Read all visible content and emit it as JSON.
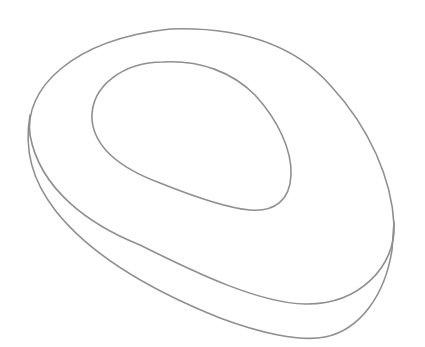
{
  "drawing": {
    "subject": "rounded oval tray outline",
    "stroke_color": "#8f8f8f",
    "background": "#ffffff",
    "stroke_width": 1.6
  }
}
